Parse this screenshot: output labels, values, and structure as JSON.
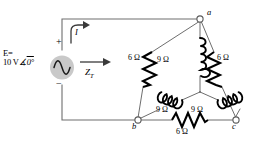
{
  "figure": {
    "type": "circuit-diagram",
    "colors": {
      "wire": "#6e6e6e",
      "component": "#000000",
      "source_fill": "#c9c9c9",
      "node_fill": "#ffffff",
      "background": "#ffffff"
    }
  },
  "source": {
    "name": "ac-voltage-source",
    "label_line1": "E=",
    "label_line2_value": "10 V",
    "label_line2_angle": "0°",
    "angle_symbol": "∠",
    "terminal_plus": "+",
    "terminal_minus": "−",
    "symbol": "sine-wave"
  },
  "annotations": {
    "current_label": "I",
    "current_arrow": "curved-arrow-up-right",
    "impedance_label": "Z",
    "impedance_subscript": "T",
    "impedance_arrow": "arrow-right"
  },
  "nodes": [
    {
      "id": "a",
      "label": "a"
    },
    {
      "id": "b",
      "label": "b"
    },
    {
      "id": "c",
      "label": "c"
    }
  ],
  "delta_branches": [
    {
      "name": "resistor-a-b",
      "label": "6 Ω",
      "value": 6,
      "unit": "Ω",
      "type": "resistor"
    },
    {
      "name": "resistor-a-c",
      "label": "6 Ω",
      "value": 6,
      "unit": "Ω",
      "type": "resistor"
    },
    {
      "name": "resistor-b-c",
      "label": "6 Ω",
      "value": 6,
      "unit": "Ω",
      "type": "resistor"
    }
  ],
  "wye_branches": [
    {
      "name": "inductor-a-center",
      "label": "9 Ω",
      "value": 9,
      "unit": "Ω",
      "type": "inductor"
    },
    {
      "name": "inductor-b-center",
      "label": "9 Ω",
      "value": 9,
      "unit": "Ω",
      "type": "inductor"
    },
    {
      "name": "inductor-c-center",
      "label": "9 Ω",
      "value": 9,
      "unit": "Ω",
      "type": "inductor"
    }
  ]
}
